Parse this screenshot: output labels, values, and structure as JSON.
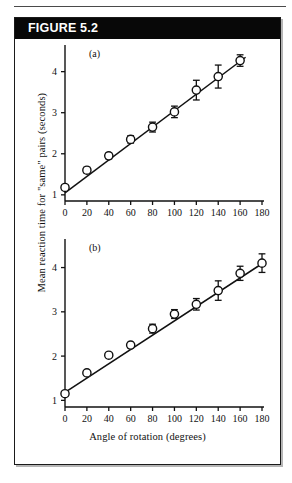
{
  "figure": {
    "banner_label": "FIGURE 5.2",
    "background_color": "#ffffff",
    "banner_color": "#080808",
    "banner_text_color": "#ffffff",
    "border_color": "#1a1a1a",
    "ink_color": "#111111"
  },
  "axis_titles": {
    "y": "Mean reaction time for \"same\" pairs (seconds)",
    "x": "Angle of rotation (degrees)"
  },
  "chart_data": [
    {
      "type": "scatter",
      "title": "(a)",
      "panel": "a",
      "xlabel": "Angle of rotation (degrees)",
      "ylabel": "Mean reaction time for \"same\" pairs (seconds)",
      "xlim": [
        0,
        180
      ],
      "ylim": [
        0.85,
        4.6
      ],
      "grid": false,
      "legend": "none",
      "marker": "open-circle",
      "error_bars": true,
      "fit_line": true,
      "xticks": [
        0,
        20,
        40,
        60,
        80,
        100,
        120,
        140,
        160,
        180
      ],
      "xtick_labels": [
        "0",
        "20",
        "40",
        "60",
        "80",
        "100",
        "120",
        "140",
        "160",
        "180"
      ],
      "yticks": [
        1,
        2,
        3,
        4
      ],
      "ytick_labels": [
        "1",
        "2",
        "3",
        "4"
      ],
      "x": [
        0,
        20,
        40,
        60,
        80,
        100,
        120,
        140,
        160
      ],
      "values": [
        1.18,
        1.6,
        1.95,
        2.35,
        2.65,
        3.02,
        3.55,
        3.88,
        4.27
      ],
      "yerr": [
        0.06,
        0.07,
        0.07,
        0.09,
        0.12,
        0.14,
        0.24,
        0.28,
        0.14
      ],
      "fit_line_endpoints": [
        [
          0,
          1.05
        ],
        [
          165,
          4.35
        ]
      ]
    },
    {
      "type": "scatter",
      "title": "(b)",
      "panel": "b",
      "xlabel": "Angle of rotation (degrees)",
      "ylabel": "Mean reaction time for \"same\" pairs (seconds)",
      "xlim": [
        0,
        180
      ],
      "ylim": [
        0.85,
        4.6
      ],
      "grid": false,
      "legend": "none",
      "marker": "open-circle",
      "error_bars": true,
      "fit_line": true,
      "xticks": [
        0,
        20,
        40,
        60,
        80,
        100,
        120,
        140,
        160,
        180
      ],
      "xtick_labels": [
        "0",
        "20",
        "40",
        "60",
        "80",
        "100",
        "120",
        "140",
        "160",
        "180"
      ],
      "yticks": [
        1,
        2,
        3,
        4
      ],
      "ytick_labels": [
        "1",
        "2",
        "3",
        "4"
      ],
      "x": [
        0,
        20,
        40,
        60,
        80,
        100,
        120,
        140,
        160,
        180
      ],
      "values": [
        1.15,
        1.62,
        2.02,
        2.25,
        2.62,
        2.95,
        3.17,
        3.48,
        3.87,
        4.1
      ],
      "yerr": [
        0.05,
        0.05,
        0.05,
        0.06,
        0.1,
        0.1,
        0.13,
        0.22,
        0.16,
        0.21
      ],
      "fit_line_endpoints": [
        [
          0,
          1.18
        ],
        [
          182,
          4.12
        ]
      ]
    }
  ]
}
